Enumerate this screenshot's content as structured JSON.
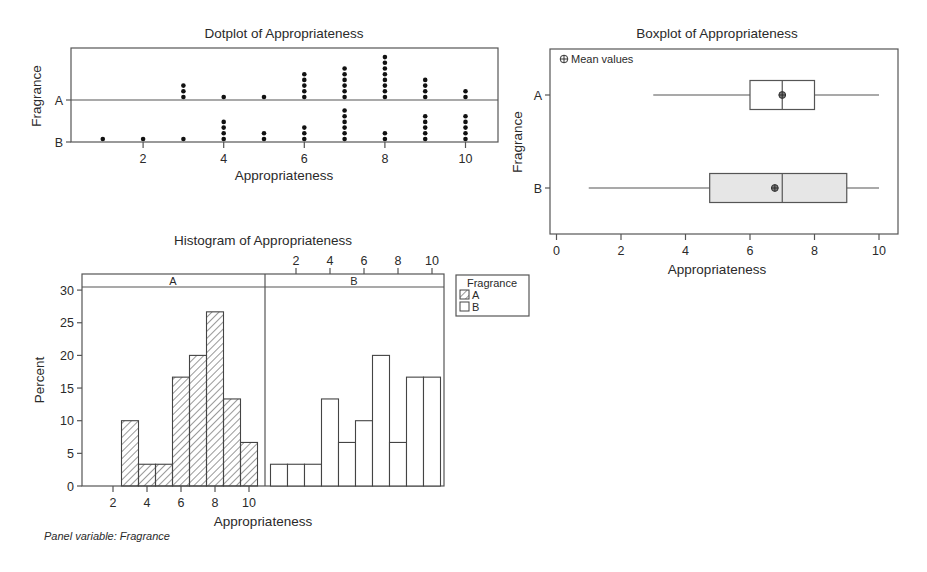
{
  "chart_data": [
    {
      "type": "dotplot",
      "title": "Dotplot of Appropriateness",
      "xlabel": "Appropriateness",
      "ylabel": "Fragrance",
      "x_ticks": [
        2,
        4,
        6,
        8,
        10
      ],
      "xlim": [
        0.3,
        10.9
      ],
      "categories": [
        "A",
        "B"
      ],
      "series": [
        {
          "name": "A",
          "values": {
            "3": 3,
            "4": 1,
            "5": 1,
            "6": 5,
            "7": 6,
            "8": 8,
            "9": 4,
            "10": 2
          }
        },
        {
          "name": "B",
          "values": {
            "1": 1,
            "2": 1,
            "3": 1,
            "4": 4,
            "5": 2,
            "6": 3,
            "7": 6,
            "8": 2,
            "9": 5,
            "10": 5
          }
        }
      ]
    },
    {
      "type": "boxplot",
      "title": "Boxplot of Appropriateness",
      "xlabel": "Appropriateness",
      "ylabel": "Fragrance",
      "legend": "Mean values",
      "x_ticks": [
        0,
        2,
        4,
        6,
        8,
        10
      ],
      "xlim": [
        -0.2,
        10.6
      ],
      "categories": [
        "A",
        "B"
      ],
      "series": [
        {
          "name": "A",
          "min": 3,
          "q1": 6,
          "median": 7,
          "q3": 8,
          "max": 10,
          "mean": 7.0,
          "fill": "#ffffff"
        },
        {
          "name": "B",
          "min": 1,
          "q1": 4.75,
          "median": 7,
          "q3": 9,
          "max": 10,
          "mean": 6.77,
          "fill": "#e6e6e6"
        }
      ]
    },
    {
      "type": "bar",
      "subtype": "paneled histogram",
      "title": "Histogram of Appropriateness",
      "xlabel": "Appropriateness",
      "ylabel": "Percent",
      "ylim": [
        0,
        31
      ],
      "y_ticks": [
        0,
        5,
        10,
        15,
        20,
        25,
        30
      ],
      "x_ticks": [
        2,
        4,
        6,
        8,
        10
      ],
      "bin_width": 1,
      "categories": [
        1,
        2,
        3,
        4,
        5,
        6,
        7,
        8,
        9,
        10
      ],
      "panels": [
        {
          "name": "A",
          "pattern": "hatched",
          "values": [
            0,
            0,
            10,
            3.33,
            3.33,
            16.67,
            20,
            26.67,
            13.33,
            6.67
          ]
        },
        {
          "name": "B",
          "pattern": "empty",
          "values": [
            3.33,
            3.33,
            3.33,
            13.33,
            6.67,
            10,
            20,
            6.67,
            16.67,
            16.67
          ]
        }
      ],
      "legend": {
        "title": "Fragrance",
        "entries": [
          "A",
          "B"
        ],
        "position": "right"
      },
      "caption": "Panel variable: Fragrance"
    }
  ]
}
